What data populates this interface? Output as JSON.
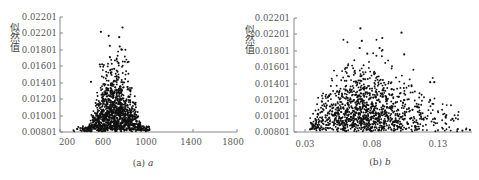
{
  "chart_data": [
    {
      "type": "scatter",
      "title": "",
      "caption": "(a) a",
      "caption_prefix": "(a)",
      "caption_var": "a",
      "xlabel": "a",
      "ylabel": "似然值",
      "xlim": [
        200,
        1800
      ],
      "ylim": [
        0.00801,
        0.02401
      ],
      "x_ticks": [
        "200",
        "600",
        "1000",
        "1400",
        "1800"
      ],
      "y_ticks": [
        "0.02201",
        "0.02201",
        "0.01801",
        "0.01601",
        "0.01401",
        "0.01201",
        "0.01001",
        "0.00801"
      ],
      "grid": false,
      "legend": null,
      "marker_color": "#111111",
      "cluster": {
        "x_center": 700,
        "x_spread": 130,
        "x_min": 320,
        "x_max": 1010,
        "y_floor": 0.00801,
        "y_peak_max": 0.0225
      },
      "outliers": [
        {
          "x": 765,
          "y": 0.02255
        },
        {
          "x": 570,
          "y": 0.02195
        },
        {
          "x": 640,
          "y": 0.0214
        },
        {
          "x": 735,
          "y": 0.0212
        },
        {
          "x": 650,
          "y": 0.02
        },
        {
          "x": 740,
          "y": 0.0199
        },
        {
          "x": 755,
          "y": 0.0195
        },
        {
          "x": 560,
          "y": 0.0174
        },
        {
          "x": 690,
          "y": 0.0168
        },
        {
          "x": 720,
          "y": 0.0164
        },
        {
          "x": 480,
          "y": 0.015
        }
      ]
    },
    {
      "type": "scatter",
      "title": "",
      "caption": "(b) b",
      "caption_prefix": "(b)",
      "caption_var": "b",
      "xlabel": "b",
      "ylabel": "似然值",
      "xlim": [
        0.02,
        0.15
      ],
      "ylim": [
        0.00801,
        0.02401
      ],
      "x_ticks": [
        "0.03",
        "0.08",
        "0.13"
      ],
      "y_ticks": [
        "0.02201",
        "0.02201",
        "0.01801",
        "0.01601",
        "0.01401",
        "0.01201",
        "0.01001",
        "0.00801"
      ],
      "grid": false,
      "legend": null,
      "marker_color": "#111111",
      "cluster": {
        "x_center": 0.065,
        "x_spread": 0.02,
        "x_min": 0.031,
        "x_max": 0.15,
        "y_floor": 0.00801,
        "y_peak_max": 0.0225
      },
      "outliers": [
        {
          "x": 0.0685,
          "y": 0.02255
        },
        {
          "x": 0.0985,
          "y": 0.02195
        },
        {
          "x": 0.0695,
          "y": 0.0208
        },
        {
          "x": 0.0845,
          "y": 0.0212
        },
        {
          "x": 0.068,
          "y": 0.0198
        },
        {
          "x": 0.0735,
          "y": 0.019
        },
        {
          "x": 0.0825,
          "y": 0.0198
        },
        {
          "x": 0.1005,
          "y": 0.0189
        },
        {
          "x": 0.1195,
          "y": 0.015
        },
        {
          "x": 0.1225,
          "y": 0.015
        },
        {
          "x": 0.1485,
          "y": 0.0083
        },
        {
          "x": 0.143,
          "y": 0.0082
        }
      ]
    }
  ]
}
